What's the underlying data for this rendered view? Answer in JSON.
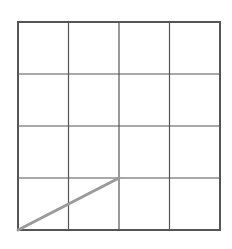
{
  "diagram": {
    "type": "grid",
    "rows": 4,
    "columns": 4,
    "bounds": {
      "left": 18,
      "top": 22,
      "right": 220,
      "bottom": 230
    },
    "colors": {
      "background": "#ffffff",
      "border": "#555555",
      "gridline": "#555555",
      "segment": "#9a9a9a"
    },
    "segment": {
      "description": "diagonal line from bottom-left corner to grid point two columns right, one row up",
      "from": {
        "col": 0,
        "row": 4
      },
      "to": {
        "col": 2,
        "row": 3
      }
    }
  }
}
